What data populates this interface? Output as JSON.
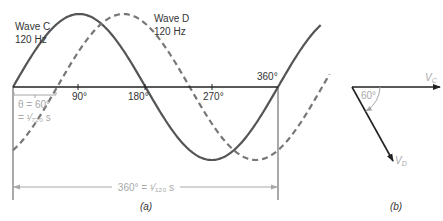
{
  "colors": {
    "wave_c": "#555555",
    "wave_d": "#777777",
    "axis": "#222222",
    "annotation": "#a8a8a8",
    "phasor": "#222222"
  },
  "panel_a": {
    "caption": "(a)",
    "wave_c": {
      "name": "Wave C",
      "freq": "120 Hz",
      "style": "solid"
    },
    "wave_d": {
      "name": "Wave D",
      "freq": "120 Hz",
      "style": "dashed"
    },
    "ticks": [
      "90°",
      "180°",
      "270°",
      "360°"
    ],
    "phase_label_1": "θ = 60°",
    "phase_label_2": "= ¹⁄₇₂₀ s",
    "period_label": "360° = ¹⁄₁₂₀ s"
  },
  "panel_b": {
    "caption": "(b)",
    "vc_label": "V",
    "vc_sub": "C",
    "vd_label": "V",
    "vd_sub": "D",
    "angle_label": "60°"
  }
}
